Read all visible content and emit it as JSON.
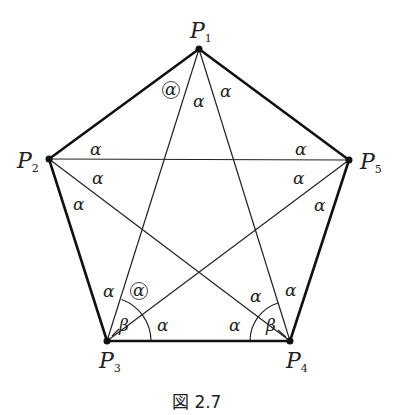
{
  "figure": {
    "caption": "図 2.7",
    "vertices": [
      {
        "id": "P1",
        "name": "P",
        "sub": "1",
        "x": 199,
        "y": 49
      },
      {
        "id": "P2",
        "name": "P",
        "sub": "2",
        "x": 49,
        "y": 159
      },
      {
        "id": "P3",
        "name": "P",
        "sub": "3",
        "x": 107,
        "y": 341
      },
      {
        "id": "P4",
        "name": "P",
        "sub": "4",
        "x": 290,
        "y": 341
      },
      {
        "id": "P5",
        "name": "P",
        "sub": "5",
        "x": 349,
        "y": 160
      }
    ],
    "edges": [
      [
        "P1",
        "P2"
      ],
      [
        "P2",
        "P3"
      ],
      [
        "P3",
        "P4"
      ],
      [
        "P4",
        "P5"
      ],
      [
        "P5",
        "P1"
      ]
    ],
    "diagonals": [
      [
        "P1",
        "P3"
      ],
      [
        "P1",
        "P4"
      ],
      [
        "P2",
        "P5"
      ],
      [
        "P2",
        "P4"
      ],
      [
        "P3",
        "P5"
      ]
    ],
    "angle_labels": {
      "alpha": "α",
      "beta": "β"
    }
  }
}
